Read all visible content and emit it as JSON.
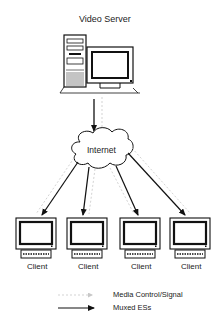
{
  "diagram": {
    "server_label": "Video Server",
    "cloud_label": "Internet",
    "clients": [
      {
        "label": "Client"
      },
      {
        "label": "Client"
      },
      {
        "label": "Client"
      },
      {
        "label": "Client"
      }
    ],
    "legend": {
      "items": [
        {
          "label": "Media Control/Signal",
          "style": "dotted-gray-arrow"
        },
        {
          "label": "Muxed ESs",
          "style": "solid-black-arrow"
        }
      ]
    },
    "colors": {
      "line": "#111111",
      "control_line": "#c8c8c8"
    }
  }
}
